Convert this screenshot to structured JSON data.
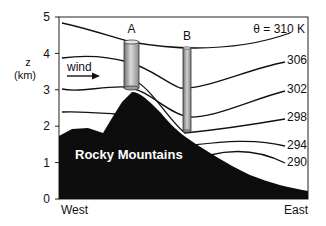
{
  "diagram": {
    "type": "cross-section",
    "title_label": "θ = 310 K",
    "y_axis": {
      "label_line1": "z",
      "label_line2": "(km)",
      "ticks": [
        "0",
        "1",
        "2",
        "3",
        "4",
        "5"
      ],
      "range_km": [
        0,
        5
      ]
    },
    "x_axis": {
      "left_label": "West",
      "right_label": "East"
    },
    "terrain": {
      "label": "Rocky Mountains",
      "color": "#0d0d0d"
    },
    "wind": {
      "label": "wind",
      "direction": "west-to-east"
    },
    "columns": [
      {
        "label": "A",
        "bottom_km": 3.05,
        "top_km": 4.3,
        "width": "wide"
      },
      {
        "label": "B",
        "bottom_km": 1.85,
        "top_km": 4.15,
        "width": "narrow"
      }
    ],
    "isentropes": [
      {
        "theta_K": 310,
        "label": "θ = 310 K"
      },
      {
        "theta_K": 306,
        "label": "306"
      },
      {
        "theta_K": 302,
        "label": "302"
      },
      {
        "theta_K": 298,
        "label": "298"
      },
      {
        "theta_K": 294,
        "label": "294"
      },
      {
        "theta_K": 290,
        "label": "290"
      }
    ],
    "colors": {
      "line": "#111111",
      "terrain": "#0d0d0d",
      "column_fill_dark": "#7a7a7a",
      "column_fill_light": "#d8d8d8",
      "background": "#ffffff"
    }
  }
}
